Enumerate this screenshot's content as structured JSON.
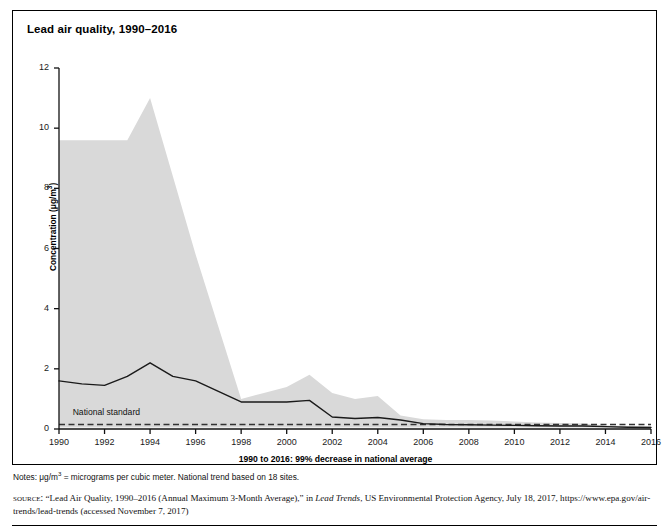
{
  "figure": {
    "title": "Lead air quality, 1990–2016",
    "x_axis_title": "1990 to 2016: 99% decrease in national average",
    "y_axis_title_prefix": "Concentration (",
    "y_axis_title_unit_mu": "μ",
    "y_axis_title_unit_g": "g/m",
    "y_axis_title_unit_exp": "3",
    "y_axis_title_suffix": ")",
    "annotation_national_standard": "National standard",
    "notes_prefix": "Notes: μg/m",
    "notes_exp": "3",
    "notes_rest": " = micrograms per cubic meter. National trend based on 18 sites.",
    "source_label": "source:",
    "source_part1": " “Lead Air Quality, 1990–2016 (Annual Maximum 3-Month Average),” in ",
    "source_italic": "Lead Trends",
    "source_part2": ", US Environmental Protection Agency, July 18, 2017, https://www.epa.gov/air-trends/lead-trends (accessed November 7, 2017)"
  },
  "colors": {
    "band_fill": "#d9d9d9",
    "trend_line": "#1a1a1a",
    "standard_line": "#333333",
    "axis": "#111111",
    "frame": "#000000",
    "background": "#ffffff"
  },
  "chart_data": {
    "type": "area",
    "title": "Lead air quality, 1990–2016",
    "subtitle": "",
    "xlabel": "1990 to 2016: 99% decrease in national average",
    "ylabel": "Concentration (μg/m3)",
    "xlim": [
      1990,
      2016
    ],
    "ylim": [
      0,
      12
    ],
    "ytick_values": [
      0,
      2,
      4,
      6,
      8,
      10,
      12
    ],
    "ytick_labels": [
      "0",
      "2",
      "4",
      "6",
      "8",
      "10",
      "12"
    ],
    "xtick_values": [
      1990,
      1992,
      1994,
      1996,
      1998,
      2000,
      2002,
      2004,
      2006,
      2008,
      2010,
      2012,
      2014,
      2016
    ],
    "xtick_labels": [
      "1990",
      "1992",
      "1994",
      "1996",
      "1998",
      "2000",
      "2002",
      "2004",
      "2006",
      "2008",
      "2010",
      "2012",
      "2014",
      "2016"
    ],
    "grid": false,
    "legend": "none",
    "x": [
      1990,
      1991,
      1992,
      1993,
      1994,
      1995,
      1996,
      1997,
      1998,
      1999,
      2000,
      2001,
      2002,
      2003,
      2004,
      2005,
      2006,
      2007,
      2008,
      2009,
      2010,
      2011,
      2012,
      2013,
      2014,
      2015,
      2016
    ],
    "series": [
      {
        "name": "90th percentile (band upper bound)",
        "type": "band_upper",
        "values": [
          9.6,
          9.6,
          9.6,
          9.6,
          11.0,
          8.4,
          5.8,
          3.4,
          1.0,
          1.2,
          1.4,
          1.8,
          1.2,
          1.0,
          1.1,
          0.45,
          0.32,
          0.3,
          0.3,
          0.28,
          0.25,
          0.22,
          0.2,
          0.18,
          0.12,
          0.1,
          0.1
        ]
      },
      {
        "name": "10th percentile (band lower bound)",
        "type": "band_lower",
        "values": [
          0.05,
          0.05,
          0.05,
          0.05,
          0.05,
          0.05,
          0.05,
          0.05,
          0.05,
          0.05,
          0.05,
          0.05,
          0.05,
          0.05,
          0.05,
          0.05,
          0.05,
          0.05,
          0.05,
          0.05,
          0.05,
          0.05,
          0.05,
          0.05,
          0.04,
          0.03,
          0.03
        ]
      },
      {
        "name": "National average (trend line)",
        "type": "line",
        "values": [
          1.6,
          1.5,
          1.45,
          1.75,
          2.2,
          1.75,
          1.6,
          1.25,
          0.9,
          0.9,
          0.9,
          0.95,
          0.4,
          0.35,
          0.38,
          0.3,
          0.18,
          0.15,
          0.14,
          0.13,
          0.12,
          0.11,
          0.1,
          0.1,
          0.08,
          0.06,
          0.05
        ]
      },
      {
        "name": "National standard",
        "type": "constant_dashed",
        "value": 0.15
      }
    ]
  }
}
